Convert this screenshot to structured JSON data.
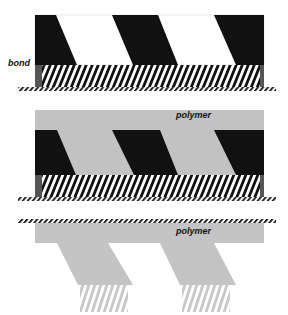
{
  "diagram": {
    "type": "process schematic",
    "panels": [
      {
        "id": "panel-1",
        "description": "stamp with dark features bonded to striped layer on hatched substrate",
        "labels": [
          "bond"
        ]
      },
      {
        "id": "panel-2",
        "description": "polymer layer filling between dark features above striped layer on hatched substrate",
        "labels": [
          "polymer"
        ]
      },
      {
        "id": "panel-3",
        "description": "transferred polymer structure with slanted legs and fringe below hatched surface",
        "labels": [
          "polymer"
        ]
      }
    ]
  },
  "labels": {
    "bond": "bond",
    "polymer_middle": "polymer",
    "polymer_bottom": "polymer"
  },
  "colors": {
    "dark": "#111111",
    "polymer_gray": "#c2c2c2",
    "light_gray": "#d4d4d4",
    "band_gray": "#555555",
    "background": "#ffffff"
  }
}
